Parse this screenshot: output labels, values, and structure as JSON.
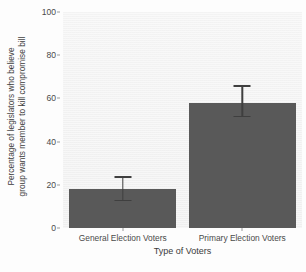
{
  "chart_data": {
    "type": "bar",
    "title": "",
    "categories": [
      "General Election Voters",
      "Primary Election Voters"
    ],
    "values": [
      18,
      58
    ],
    "error_low": [
      13,
      52
    ],
    "error_high": [
      24,
      66
    ],
    "xlabel": "Type of Voters",
    "ylabel_line1": "Percentage of legislators who believe",
    "ylabel_line2": "group wants member to kill compromise bill",
    "ylim": [
      0,
      100
    ],
    "yticks": [
      0,
      20,
      40,
      60,
      80,
      100
    ],
    "ytick_labels": [
      "0",
      "20",
      "40",
      "60",
      "80",
      "100"
    ],
    "grid": false,
    "legend": "none",
    "bar_color": "#595959",
    "errorbar_color": "#3f3f3f",
    "panel_color": "#f4f4f4",
    "figure_color": "#fdfdfd"
  }
}
